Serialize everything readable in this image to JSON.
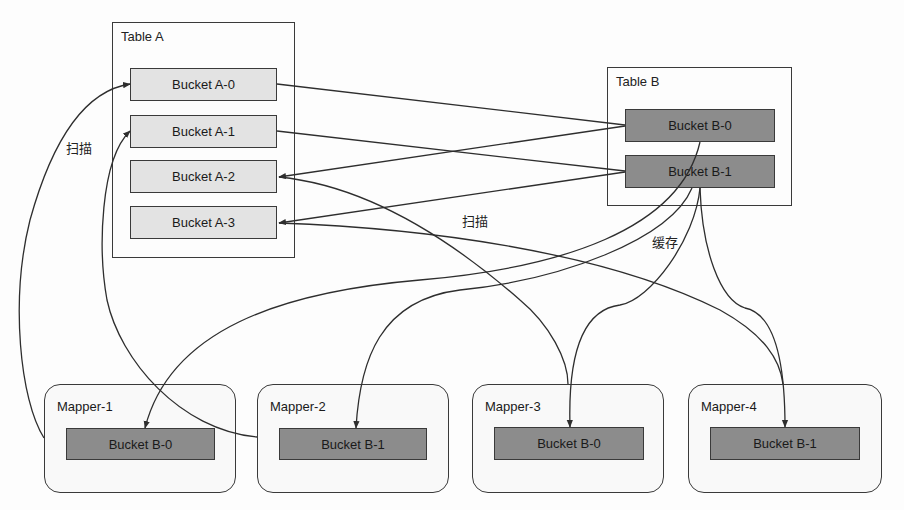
{
  "diagram": {
    "table_a": {
      "title": "Table A",
      "buckets": [
        "Bucket A-0",
        "Bucket A-1",
        "Bucket A-2",
        "Bucket A-3"
      ]
    },
    "table_b": {
      "title": "Table B",
      "buckets": [
        "Bucket B-0",
        "Bucket B-1"
      ]
    },
    "mappers": [
      {
        "title": "Mapper-1",
        "bucket": "Bucket B-0"
      },
      {
        "title": "Mapper-2",
        "bucket": "Bucket B-1"
      },
      {
        "title": "Mapper-3",
        "bucket": "Bucket B-0"
      },
      {
        "title": "Mapper-4",
        "bucket": "Bucket B-1"
      }
    ],
    "labels": {
      "scan_left": "扫描",
      "scan_middle": "扫描",
      "cache": "缓存"
    },
    "colors": {
      "line": "#2e2e2e",
      "light_bucket": "#e3e3e3",
      "dark_bucket": "#8c8c8c",
      "border": "#3a3a3a"
    }
  }
}
